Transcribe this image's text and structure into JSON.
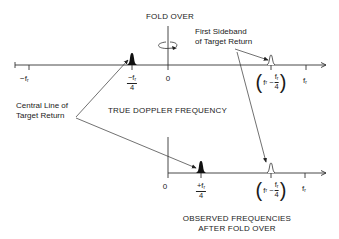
{
  "diagram": {
    "fold_over_label": "FOLD OVER",
    "first_sideband_label_line1": "First Sideband",
    "first_sideband_label_line2": "of Target Return",
    "central_line_label_line1": "Central Line of",
    "central_line_label_line2": "Target Return",
    "top_axis_caption": "TRUE DOPPLER FREQUENCY",
    "bottom_axis_caption_line1": "OBSERVED FREQUENCIES",
    "bottom_axis_caption_line2": "AFTER FOLD OVER",
    "top_axis": {
      "ticks": {
        "neg_fr": "−f",
        "neg_fr_sub": "r",
        "neg_fr4_num": "−f",
        "neg_fr4_sub": "r",
        "neg_fr4_den": "4",
        "zero": "0",
        "sideband_f": "f",
        "sideband_sub": "r",
        "sideband_minus": "−",
        "sideband_num": "f",
        "sideband_num_sub": "r",
        "sideband_den": "4",
        "fr": "f",
        "fr_sub": "r"
      }
    },
    "bottom_axis": {
      "ticks": {
        "zero": "0",
        "pos_fr4_num": "+f",
        "pos_fr4_sub": "r",
        "pos_fr4_den": "4",
        "sideband_f": "f",
        "sideband_sub": "r",
        "sideband_minus": "−",
        "sideband_num": "f",
        "sideband_num_sub": "r",
        "sideband_den": "4",
        "fr": "f",
        "fr_sub": "r"
      }
    },
    "colors": {
      "line": "#333333",
      "filled_peak": "#111111",
      "background": "#ffffff"
    }
  }
}
